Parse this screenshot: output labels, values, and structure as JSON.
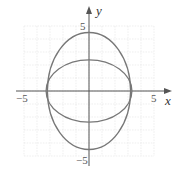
{
  "chart_data": {
    "type": "line",
    "title": "",
    "xlabel": "x",
    "ylabel": "y",
    "xlim": [
      -5,
      5
    ],
    "ylim": [
      -5,
      5
    ],
    "grid": true,
    "tick_labels": {
      "x": [
        "-5",
        "5"
      ],
      "y": [
        "5",
        "-5"
      ]
    },
    "series": [
      {
        "name": "tall ellipse",
        "shape": "ellipse",
        "center": [
          0,
          0
        ],
        "semi_x": 3.2,
        "semi_y": 4.5
      },
      {
        "name": "wide ellipse",
        "shape": "ellipse",
        "center": [
          0,
          0
        ],
        "semi_x": 3.3,
        "semi_y": 2.4
      }
    ]
  },
  "labels": {
    "x_axis": "x",
    "y_axis": "y",
    "x_min": "−5",
    "x_max": "5",
    "y_max": "5",
    "y_min": "−5"
  },
  "colors": {
    "curve": "#777777",
    "grid": "#dddddd",
    "axis": "#555555"
  }
}
